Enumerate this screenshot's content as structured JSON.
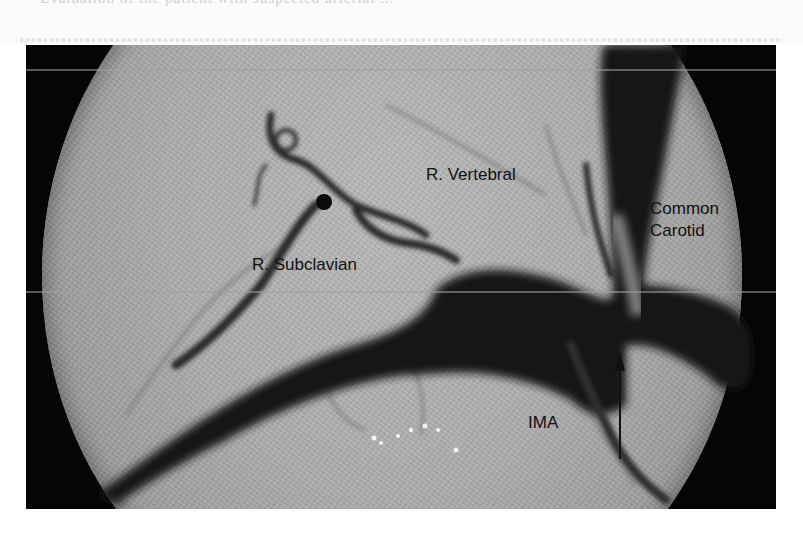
{
  "figure": {
    "page_fragment_text": "Evaluation of the patient with suspected arterial ...",
    "image_type": "angiogram",
    "labels": {
      "r_vertebral": "R. Vertebral",
      "common_carotid_line1": "Common",
      "common_carotid_line2": "Carotid",
      "r_subclavian": "R. Subclavian",
      "ima": "IMA"
    },
    "annotations": [
      {
        "type": "arrow",
        "direction": "up",
        "pointing_to": "origin stenosis near common carotid / brachiocephalic junction"
      }
    ],
    "colors": {
      "background": "#ffffff",
      "frame": "#050505",
      "field": "#acacac",
      "vessel": "#141414",
      "label_text": "#111111"
    }
  }
}
